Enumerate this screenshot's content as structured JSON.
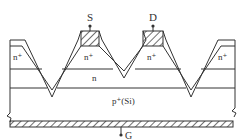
{
  "diagram": {
    "type": "V-groove MOSFET cross-section",
    "terminals": {
      "source": "S",
      "drain": "D",
      "gate": "G"
    },
    "regions": {
      "n_plus_left": "n⁺",
      "n_plus_source": "n⁺",
      "n_plus_drain": "n⁺",
      "n_plus_right": "n⁺",
      "n_layer": "n",
      "substrate": "p⁺(Si)"
    },
    "colors": {
      "line": "#333333",
      "background": "#ffffff"
    }
  }
}
